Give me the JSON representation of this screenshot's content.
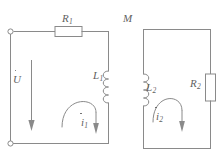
{
  "diagram": {
    "stroke_color": "#8a8a8a",
    "label_color": "#5f5f5f",
    "background_color": "#ffffff",
    "labels": {
      "resistor_1": {
        "symbol": "R",
        "subscript": "1",
        "dot": false
      },
      "resistor_2": {
        "symbol": "R",
        "subscript": "2",
        "dot": false
      },
      "inductor_1": {
        "symbol": "L",
        "subscript": "1",
        "dot": false
      },
      "inductor_2": {
        "symbol": "L",
        "subscript": "2",
        "dot": false
      },
      "mutual_inductance": {
        "symbol": "M",
        "subscript": "",
        "dot": false
      },
      "source_voltage": {
        "symbol": "U",
        "subscript": "",
        "dot": true
      },
      "current_1": {
        "symbol": "i",
        "subscript": "1",
        "dot": true
      },
      "current_2": {
        "symbol": "i",
        "subscript": "2",
        "dot": true
      }
    },
    "components": [
      {
        "name": "terminal-top-left",
        "type": "open-terminal"
      },
      {
        "name": "terminal-bottom-left",
        "type": "open-terminal"
      },
      {
        "name": "resistor-R1",
        "type": "resistor",
        "orientation": "horizontal"
      },
      {
        "name": "resistor-R2",
        "type": "resistor",
        "orientation": "vertical"
      },
      {
        "name": "inductor-L1",
        "type": "inductor",
        "orientation": "vertical"
      },
      {
        "name": "inductor-L2",
        "type": "inductor",
        "orientation": "vertical"
      },
      {
        "name": "voltage-arrow-U",
        "type": "arrow",
        "direction": "down"
      },
      {
        "name": "current-arrow-i1",
        "type": "arrow",
        "direction": "down"
      },
      {
        "name": "current-arrow-i2",
        "type": "arrow",
        "direction": "down"
      },
      {
        "name": "loop-arrow-primary",
        "type": "loop-arc",
        "direction": "clockwise"
      },
      {
        "name": "loop-arrow-secondary",
        "type": "loop-arc",
        "direction": "clockwise"
      }
    ]
  }
}
